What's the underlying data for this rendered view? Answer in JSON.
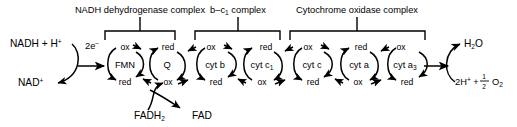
{
  "diagram": {
    "stroke_color": "#000000",
    "background_color": "#ffffff",
    "complexes": [
      {
        "id": "nadh-dehydrogenase",
        "label": "NADH dehydrogenase complex",
        "label_x": 140,
        "label_y": 13,
        "bracket_left": 105,
        "bracket_right": 175,
        "bracket_top": 31,
        "bracket_bottom": 40,
        "stem_top": 17,
        "members": [
          "FMN",
          "Q"
        ]
      },
      {
        "id": "b-c1",
        "label_pre": "b–c",
        "label_sub": "1",
        "label_post": " complex",
        "label_x": 238,
        "label_y": 13,
        "bracket_left": 195,
        "bracket_right": 280,
        "bracket_top": 31,
        "bracket_bottom": 40,
        "stem_top": 17,
        "members": [
          "cyt b",
          "cyt c1"
        ]
      },
      {
        "id": "cytochrome-oxidase",
        "label": "Cytochrome oxidase complex",
        "label_x": 357,
        "label_y": 13,
        "bracket_left": 290,
        "bracket_right": 425,
        "bracket_top": 31,
        "bracket_bottom": 40,
        "stem_top": 17,
        "members": [
          "cyt c",
          "cyt a",
          "cyt a3"
        ]
      }
    ],
    "cycles": [
      {
        "id": "fmn",
        "name_pre": "FMN",
        "name_sub": "",
        "cx": 125,
        "cy": 64,
        "top_state": "ox",
        "bottom_state": "red"
      },
      {
        "id": "q",
        "name_pre": "Q",
        "name_sub": "",
        "cx": 167,
        "cy": 64,
        "top_state": "red",
        "bottom_state": "ox"
      },
      {
        "id": "cyt-b",
        "name_pre": "cyt b",
        "name_sub": "",
        "cx": 215,
        "cy": 64,
        "top_state": "ox",
        "bottom_state": "red"
      },
      {
        "id": "cyt-c1",
        "name_pre": "cyt c",
        "name_sub": "1",
        "cx": 262,
        "cy": 64,
        "top_state": "red",
        "bottom_state": "ox"
      },
      {
        "id": "cyt-c",
        "name_pre": "cyt c",
        "name_sub": "",
        "cx": 312,
        "cy": 64,
        "top_state": "ox",
        "bottom_state": "red"
      },
      {
        "id": "cyt-a",
        "name_pre": "cyt a",
        "name_sub": "",
        "cx": 359,
        "cy": 64,
        "top_state": "red",
        "bottom_state": "ox"
      },
      {
        "id": "cyt-a3",
        "name_pre": "cyt a",
        "name_sub": "3",
        "cx": 406,
        "cy": 64,
        "top_state": "ox",
        "bottom_state": "red"
      }
    ],
    "species": [
      {
        "id": "nadh",
        "text_pre": "NADH + H",
        "text_sup": "+",
        "text_sub": "",
        "text_post": "",
        "x": 10,
        "y": 47
      },
      {
        "id": "nad",
        "text_pre": "NAD",
        "text_sup": "+",
        "text_sub": "",
        "text_post": "",
        "x": 18,
        "y": 86
      },
      {
        "id": "fadh2",
        "text_pre": "FADH",
        "text_sup": "",
        "text_sub": "2",
        "text_post": "",
        "x": 134,
        "y": 119
      },
      {
        "id": "fad",
        "text_pre": "FAD",
        "text_sup": "",
        "text_sub": "",
        "text_post": "",
        "x": 192,
        "y": 119
      },
      {
        "id": "h2o",
        "text_pre": "H",
        "text_sup": "",
        "text_sub": "2",
        "text_post": "O",
        "x": 464,
        "y": 47
      }
    ],
    "electron_label": {
      "text_pre": "2e",
      "text_sup": "−",
      "x": 85,
      "y": 49
    },
    "oxygen_label": {
      "prefix": "2H",
      "prefix_sup": "+",
      "plus": " + ",
      "frac_num": "1",
      "frac_den": "2",
      "suffix_pre": "O",
      "suffix_sub": "2",
      "x": 455,
      "y": 85
    },
    "states": {
      "ox": "ox",
      "red": "red"
    }
  }
}
